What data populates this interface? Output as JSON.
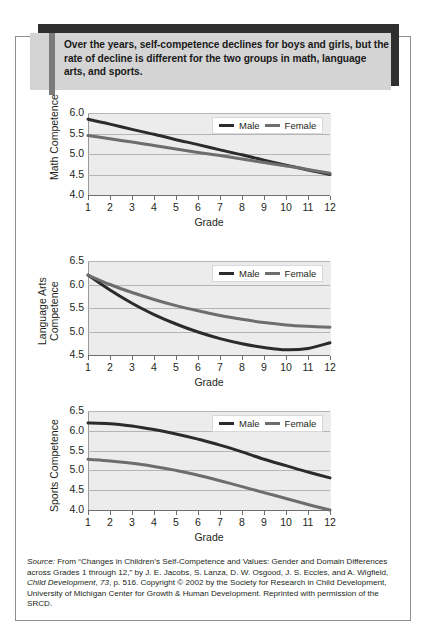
{
  "caption": {
    "text": "Over the years, self-competence declines for boys and girls, but the rate of decline is different for the two groups in math, language arts, and sports."
  },
  "legend": {
    "male_label": "Male",
    "female_label": "Female",
    "male_color": "#2b2b2b",
    "female_color": "#6d6d6d"
  },
  "source": {
    "label": "Source:",
    "line1": " From “Changes in Children’s Self-Competence and Values: Gender and Domain Differences across Grades 1 through 12,” by J. E. Jacobs, S. Lanza, D. W. Osgood, J. S. Eccles, and A. Wigfield, ",
    "journal": "Child Development",
    "volume": "73",
    "line2": ", p. 516. Copyright © 2002 by the Society for Research in Child Development, University of Michigan Center for Growth & Human Development. Reprinted with permission of the SRCD."
  },
  "chart_data": [
    {
      "type": "line",
      "title": "Math Competence",
      "ylabel": "Math Competence",
      "xlabel": "Grade",
      "x": [
        1,
        2,
        3,
        4,
        5,
        6,
        7,
        8,
        9,
        10,
        11,
        12
      ],
      "xticklabels": [
        "1",
        "2",
        "3",
        "4",
        "5",
        "6",
        "7",
        "8",
        "9",
        "10",
        "11",
        "12"
      ],
      "yticklabels": [
        "4.0",
        "4.5",
        "5.0",
        "5.5",
        "6.0"
      ],
      "ylim": [
        4.0,
        6.0
      ],
      "xlim": [
        1,
        12
      ],
      "grid": true,
      "legend_position": "top-right",
      "series": [
        {
          "name": "Male",
          "values": [
            5.85,
            5.73,
            5.6,
            5.48,
            5.35,
            5.23,
            5.1,
            4.98,
            4.85,
            4.73,
            4.61,
            4.5
          ]
        },
        {
          "name": "Female",
          "values": [
            5.45,
            5.37,
            5.29,
            5.21,
            5.12,
            5.04,
            4.96,
            4.88,
            4.79,
            4.71,
            4.62,
            4.53
          ]
        }
      ]
    },
    {
      "type": "line",
      "title": "Language Arts Competence",
      "ylabel": "Language Arts Competence",
      "xlabel": "Grade",
      "x": [
        1,
        2,
        3,
        4,
        5,
        6,
        7,
        8,
        9,
        10,
        11,
        12
      ],
      "xticklabels": [
        "1",
        "2",
        "3",
        "4",
        "5",
        "6",
        "7",
        "8",
        "9",
        "10",
        "11",
        "12"
      ],
      "yticklabels": [
        "4.5",
        "5.0",
        "5.5",
        "6.0",
        "6.5"
      ],
      "ylim": [
        4.5,
        6.5
      ],
      "xlim": [
        1,
        12
      ],
      "grid": true,
      "legend_position": "top-right",
      "series": [
        {
          "name": "Male",
          "values": [
            6.2,
            5.88,
            5.6,
            5.36,
            5.16,
            4.99,
            4.85,
            4.74,
            4.66,
            4.61,
            4.64,
            4.76
          ]
        },
        {
          "name": "Female",
          "values": [
            6.2,
            6.0,
            5.83,
            5.68,
            5.55,
            5.44,
            5.34,
            5.26,
            5.19,
            5.14,
            5.11,
            5.09
          ]
        }
      ]
    },
    {
      "type": "line",
      "title": "Sports Competence",
      "ylabel": "Sports Competence",
      "xlabel": "Grade",
      "x": [
        1,
        2,
        3,
        4,
        5,
        6,
        7,
        8,
        9,
        10,
        11,
        12
      ],
      "xticklabels": [
        "1",
        "2",
        "3",
        "4",
        "5",
        "6",
        "7",
        "8",
        "9",
        "10",
        "11",
        "12"
      ],
      "yticklabels": [
        "4.0",
        "4.5",
        "5.0",
        "5.5",
        "6.0",
        "6.5"
      ],
      "ylim": [
        4.0,
        6.5
      ],
      "xlim": [
        1,
        12
      ],
      "grid": true,
      "legend_position": "top-right",
      "series": [
        {
          "name": "Male",
          "values": [
            6.2,
            6.18,
            6.12,
            6.03,
            5.92,
            5.79,
            5.64,
            5.47,
            5.28,
            5.12,
            4.96,
            4.81
          ]
        },
        {
          "name": "Female",
          "values": [
            5.28,
            5.24,
            5.18,
            5.1,
            5.0,
            4.88,
            4.74,
            4.59,
            4.44,
            4.29,
            4.14,
            4.0
          ]
        }
      ]
    }
  ]
}
